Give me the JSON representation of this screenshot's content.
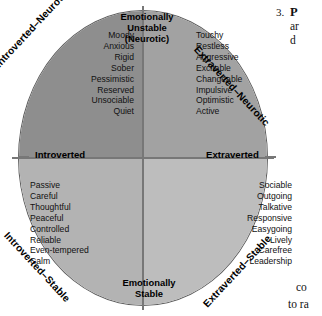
{
  "figure": {
    "name": "eysenck-personality-circumplex",
    "colors": {
      "quadrant_upper_left": "#8e8e8e",
      "quadrant_upper_right": "#a2a2a2",
      "quadrant_lower_left": "#b3b3b3",
      "quadrant_lower_right": "#bdbdbd",
      "outline": "#5d5d5d",
      "axis": "#777777",
      "text": "#111111"
    },
    "axes": {
      "top_label": "Emotionally\nUnstable\n(Neurotic)",
      "top_line_1": "Emotionally",
      "top_line_2": "Unstable",
      "top_line_3": "(Neurotic)",
      "bottom_line_1": "Emotionally",
      "bottom_line_2": "Stable",
      "left_label": "Introverted",
      "right_label": "Extraverted"
    },
    "diagonals": {
      "upper_left": "Introverted–Neurotic",
      "upper_right": "Extraverted–Neurotic",
      "lower_left": "Introverted–Stable",
      "lower_right": "Extraverted–Stable"
    },
    "quadrants": {
      "upper_left": {
        "name": "introverted-neurotic",
        "traits": [
          "Moody",
          "Anxious",
          "Rigid",
          "Sober",
          "Pessimistic",
          "Reserved",
          "Unsociable",
          "Quiet"
        ]
      },
      "upper_right": {
        "name": "extraverted-neurotic",
        "traits": [
          "Touchy",
          "Restless",
          "Aggressive",
          "Excitable",
          "Changeable",
          "Impulsive",
          "Optimistic",
          "Active"
        ]
      },
      "lower_left": {
        "name": "introverted-stable",
        "traits": [
          "Passive",
          "Careful",
          "Thoughtful",
          "Peaceful",
          "Controlled",
          "Reliable",
          "Even-tempered",
          "Calm"
        ]
      },
      "lower_right": {
        "name": "extraverted-stable",
        "traits": [
          "Sociable",
          "Outgoing",
          "Talkative",
          "Responsive",
          "Easygoing",
          "Lively",
          "Carefree",
          "Leadership"
        ]
      }
    }
  },
  "page_text": {
    "item_number": "3.",
    "line_1": "P",
    "line_2": "ar",
    "line_3": "d",
    "bottom_line_1": "co",
    "bottom_line_2": "to ra"
  }
}
